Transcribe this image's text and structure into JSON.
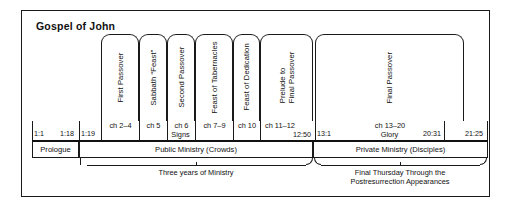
{
  "title": "Gospel of John",
  "sections": [
    {
      "label": "First Passover",
      "ref": "ch 2–4"
    },
    {
      "label": "Sabbath “Feast”",
      "ref": "ch 5"
    },
    {
      "label": "Second Passover",
      "ref": "ch 6"
    },
    {
      "label": "Feast of Tabernacles",
      "ref": "ch 7–9"
    },
    {
      "label": "Feast of Dedication",
      "ref": "ch 10"
    },
    {
      "label": "Prelude to\nFinal Passover",
      "label_line1": "Prelude to",
      "label_line2": "Final Passover",
      "ref": "ch 11–12"
    },
    {
      "label": "Final Passover",
      "ref": "ch 13–20"
    }
  ],
  "verse_marks": {
    "start": "1:1",
    "prologue_end": "1:18",
    "body_start": "1:19",
    "signs_end": "12:50",
    "glory_start": "13:1",
    "glory_end": "20:31",
    "book_end": "21:25"
  },
  "span_labels": {
    "signs": "Signs",
    "glory": "Glory"
  },
  "bands": [
    {
      "name": "Prologue",
      "text": "Prologue"
    },
    {
      "name": "Public Ministry (Crowds)",
      "text": "Public Ministry (Crowds)"
    },
    {
      "name": "Private Ministry (Disciples)",
      "text": "Private Ministry (Disciples)"
    }
  ],
  "captions": {
    "public": "Three years of Ministry",
    "private_line1": "Final Thursday Through the",
    "private_line2": "Postresurrection Appearances"
  },
  "colors": {
    "ink": "#1a1a1a",
    "background": "#ffffff"
  }
}
